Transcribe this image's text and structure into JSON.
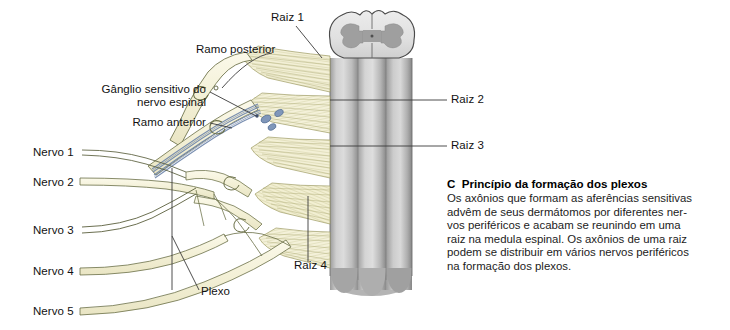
{
  "figure": {
    "id": "plexus-formation-figure",
    "labels_left": [
      {
        "name": "ramo-posterior",
        "text": "Ramo posterior",
        "x": 196,
        "y": 49,
        "align": "left"
      },
      {
        "name": "ganglio-sensitivo-linha1",
        "text": "Gânglio sensitivo do",
        "x": 88,
        "y": 89,
        "align": "right",
        "width": 118
      },
      {
        "name": "ganglio-sensitivo-linha2",
        "text": "nervo espinal",
        "x": 88,
        "y": 102,
        "align": "right",
        "width": 118
      },
      {
        "name": "ramo-anterior",
        "text": "Ramo anterior",
        "x": 95,
        "y": 119,
        "align": "right",
        "width": 111
      },
      {
        "name": "nervo-1",
        "text": "Nervo 1",
        "x": 33,
        "y": 148,
        "align": "left"
      },
      {
        "name": "nervo-2",
        "text": "Nervo 2",
        "x": 33,
        "y": 180,
        "align": "left"
      },
      {
        "name": "nervo-3",
        "text": "Nervo 3",
        "x": 33,
        "y": 225,
        "align": "left"
      },
      {
        "name": "nervo-4",
        "text": "Nervo 4",
        "x": 33,
        "y": 270,
        "align": "left"
      },
      {
        "name": "nervo-5",
        "text": "Nervo 5",
        "x": 33,
        "y": 308,
        "align": "left"
      },
      {
        "name": "plexo",
        "text": "Plexo",
        "x": 201,
        "y": 288,
        "align": "left"
      },
      {
        "name": "raiz-4",
        "text": "Raiz 4",
        "x": 296,
        "y": 265,
        "align": "left"
      }
    ],
    "labels_top": [
      {
        "name": "raiz-1",
        "text": "Raiz 1",
        "x": 271,
        "y": 14,
        "align": "left"
      }
    ],
    "labels_right": [
      {
        "name": "raiz-2",
        "text": "Raiz 2",
        "x": 451,
        "y": 95,
        "align": "left"
      },
      {
        "name": "raiz-3",
        "text": "Raiz 3",
        "x": 451,
        "y": 141,
        "align": "left"
      }
    ],
    "colors": {
      "nerve_fill": "#f4f1dc",
      "nerve_outline": "#5a5f3c",
      "rootlet_fill": "#f2efd5",
      "rootlet_stroke": "#a9a86a",
      "cord_light": "#d8d8d8",
      "cord_mid": "#b9b9b9",
      "cord_dark": "#8e8e8e",
      "gray_matter": "#a6a6a6",
      "white_matter": "#e3e3e3",
      "fiber_blue": "#6f86ab",
      "leader_line": "#3a3a3a",
      "text": "#121212"
    }
  },
  "caption": {
    "letter": "C",
    "heading": "Princípio da formação dos plexos",
    "heading_full": "C  Princípio da formação dos plexos",
    "lines": [
      "Os axônios que formam as aferências sensitivas",
      "advêm de seus dermátomos por diferentes ner-",
      "vos periféricos e acabam se reunindo em uma",
      "raiz na medula espinal. Os axônios de uma raiz",
      "podem se distribuir em vários nervos periféricos",
      "na formação dos plexos."
    ],
    "body": "Os axônios que formam as aferências sensitivas advêm de seus dermátomos por diferentes nervos periféricos e acabam se reunindo em uma raiz na medula espinal. Os axônios de uma raiz podem se distribuir em vários nervos periféricos na formação dos plexos."
  }
}
